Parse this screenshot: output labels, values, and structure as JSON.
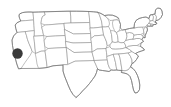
{
  "map": {
    "title": "United States Map",
    "description": "Outline map of the contiguous United States with state boundaries",
    "background_color": "#ffffff",
    "state_border_color": "#8a8a8a",
    "coastline_color": "#6e6e6e",
    "state_fill_color": "#ffffff",
    "width": 171,
    "height": 107
  },
  "marker": {
    "name": "location-marker",
    "shape": "circle",
    "color": "#3a3a3a",
    "center_x": 17.5,
    "center_y": 53.5,
    "radius": 5.2,
    "state": "California",
    "label": ""
  },
  "regions": {
    "west": "Western United States",
    "midwest": "Midwestern United States",
    "south": "Southern United States",
    "northeast": "Northeastern United States"
  }
}
